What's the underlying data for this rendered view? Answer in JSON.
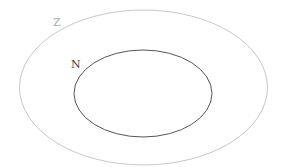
{
  "diagram": {
    "type": "venn-nested-sets",
    "sets": [
      {
        "id": "outer",
        "label": "Z",
        "stroke": "#c8c8c8",
        "label_color": "#b0b0b0",
        "contains": [
          "N"
        ]
      },
      {
        "id": "inner",
        "label": "N",
        "stroke": "#555555",
        "label_color": "#444444",
        "contains": []
      }
    ]
  }
}
